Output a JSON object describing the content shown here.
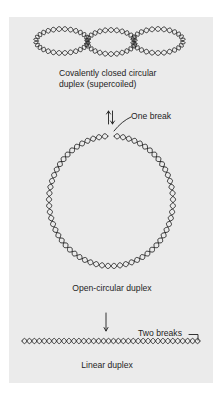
{
  "figure": {
    "panel_color": "#ebebeb",
    "ink_color": "#1e1e1e",
    "supercoiled": {
      "caption_line1": "Covalently closed circular",
      "caption_line2": "duplex (supercoiled)"
    },
    "open_circular": {
      "break_label": "One break",
      "caption": "Open-circular duplex"
    },
    "linear": {
      "break_label": "Two breaks",
      "caption": "Linear duplex"
    }
  }
}
